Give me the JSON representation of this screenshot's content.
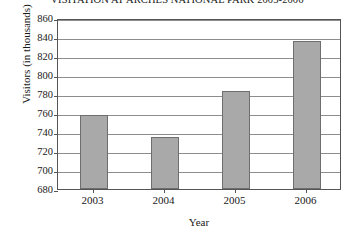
{
  "chart_data": {
    "type": "bar",
    "title": "VISITATION AT ARCHES NATIONAL PARK 2003-2006",
    "xlabel": "Year",
    "ylabel": "Visitors (in thousands)",
    "categories": [
      "2003",
      "2004",
      "2005",
      "2006"
    ],
    "values": [
      758,
      735,
      783,
      836
    ],
    "ylim": [
      680,
      860
    ],
    "ytick_step": 20,
    "yticks": [
      680,
      700,
      720,
      740,
      760,
      780,
      800,
      820,
      840,
      860
    ],
    "ytick_labels": [
      "680",
      "700",
      "720",
      "740",
      "760",
      "780",
      "800",
      "820",
      "840",
      "860"
    ],
    "grid": true,
    "grid_axis": "y",
    "legend": false,
    "bar_color": "#a9a9a9",
    "bar_border_color": "#6e6e6e",
    "axis_color": "#555555",
    "gridline_color": "#8d8d8d",
    "background": "#ffffff"
  }
}
